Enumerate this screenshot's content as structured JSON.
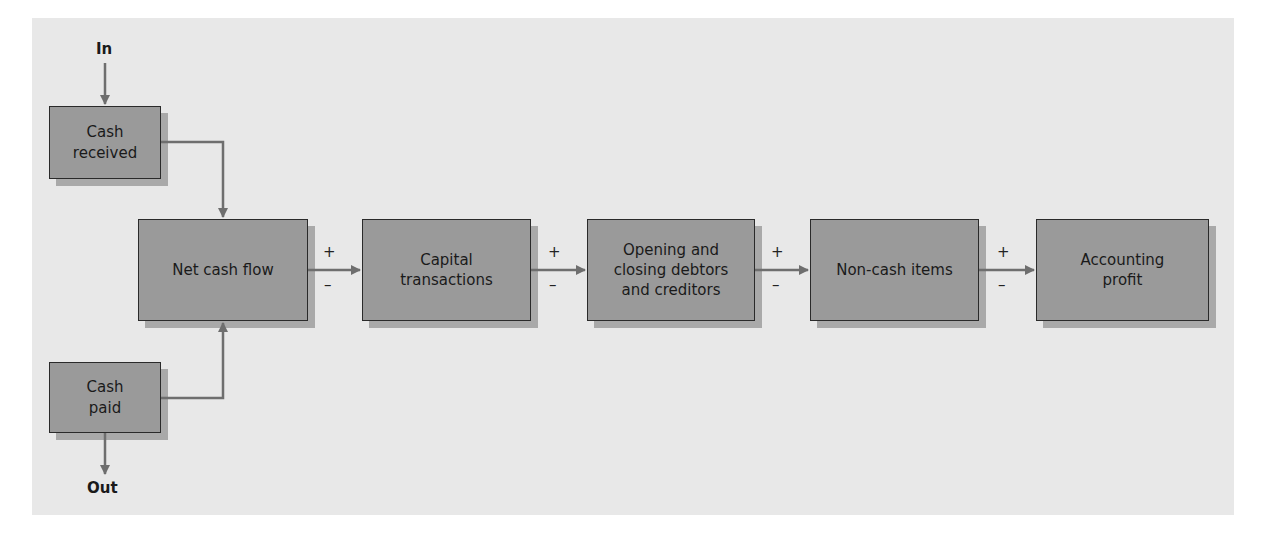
{
  "diagram": {
    "input_label": "In",
    "output_label": "Out",
    "boxes": {
      "cash_received": "Cash\nreceived",
      "cash_paid": "Cash\npaid",
      "net_cash_flow": "Net cash flow",
      "capital_transactions": "Capital\ntransactions",
      "debtors_creditors": "Opening and\nclosing debtors\nand creditors",
      "non_cash_items": "Non-cash items",
      "accounting_profit": "Accounting\nprofit"
    },
    "connectors": [
      {
        "plus": "+",
        "minus": "–"
      },
      {
        "plus": "+",
        "minus": "–"
      },
      {
        "plus": "+",
        "minus": "–"
      },
      {
        "plus": "+",
        "minus": "–"
      }
    ],
    "colors": {
      "panel": "#e8e8e8",
      "box_fill": "#9a9a9a",
      "box_border": "#2a2a2a",
      "shadow": "#a9a9a9",
      "arrow": "#6e6e6e"
    }
  }
}
